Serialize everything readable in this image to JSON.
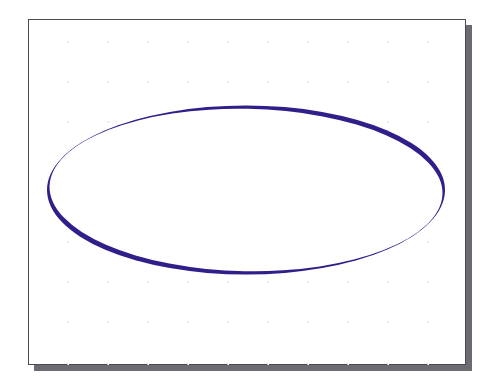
{
  "figure": {
    "shape": "ellipse",
    "stroke_style": "calligraphic (variable width)",
    "colors": {
      "background": "#ffffff",
      "canvas": "#ffffff",
      "border": "#4a4a50",
      "shadow": "#6b6b72",
      "stroke": "#2e1f8a",
      "grid_dot": "#c8c8cc"
    },
    "grid": {
      "visible": true,
      "style": "dots",
      "columns": 10,
      "rows": 8
    }
  }
}
